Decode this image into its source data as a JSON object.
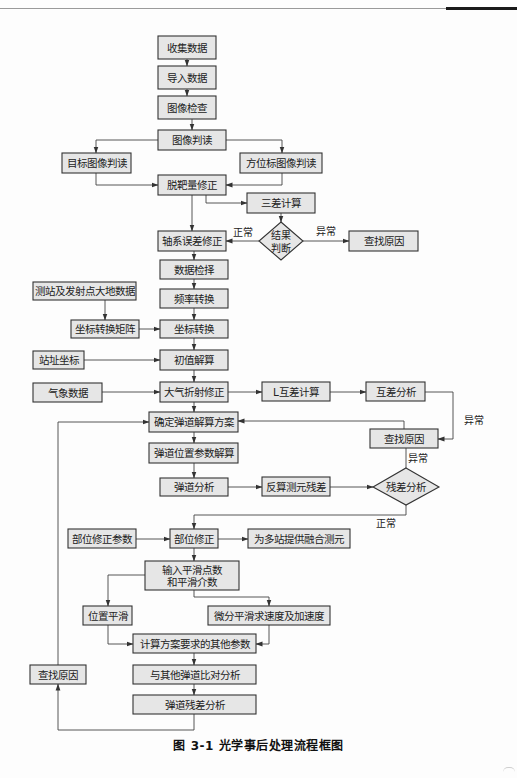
{
  "figure": {
    "caption": "图 3-1    光学事后处理流程框图",
    "colors": {
      "box_fill": "#e6e6e6",
      "box_stroke": "#333333",
      "line": "#444444",
      "background": "#fdfdfd"
    }
  },
  "nodes": {
    "collect_data": "收集数据",
    "import_data": "导入数据",
    "image_check": "图像检查",
    "image_interpret": "图像判读",
    "target_image_interpret": "目标图像判读",
    "azimuth_mark_interpret": "方位标图像判读",
    "miss_distance_correction": "脱靶量修正",
    "three_diff_calc": "三差计算",
    "result_judge_line1": "结果",
    "result_judge_line2": "判断",
    "find_cause_top": "查找原因",
    "axis_error_correction": "轴系误差修正",
    "data_selection": "数据检择",
    "station_geodetic_data": "测站及发射点大地数据",
    "frequency_conversion": "频率转换",
    "coord_transform_matrix": "坐标转换矩阵",
    "coord_transform": "坐标转换",
    "station_coords": "站址坐标",
    "initial_solution": "初值解算",
    "meteorological_data": "气象数据",
    "atmos_refraction_correction": "大气折射修正",
    "l_mutual_diff_calc": "L互差计算",
    "mutual_diff_analysis": "互差分析",
    "determine_trajectory_plan": "确定弹道解算方案",
    "find_cause_mid": "查找原因",
    "trajectory_position_solution": "弹道位置参数解算",
    "trajectory_analysis": "弹道分析",
    "back_calc_residual": "反算测元残差",
    "residual_analysis": "残差分析",
    "part_correction_params": "部位修正参数",
    "part_correction": "部位修正",
    "multi_station_fusion": "为多站提供融合测元",
    "smoothing_input_line1": "输入平滑点数",
    "smoothing_input_line2": "和平滑介数",
    "position_smoothing": "位置平滑",
    "diff_smoothing_vel_acc": "微分平滑求速度及加速度",
    "calc_other_params": "计算方案要求的其他参数",
    "compare_other_trajectories": "与其他弹道比对分析",
    "find_cause_bottom": "查找原因",
    "trajectory_residual_analysis": "弹道残差分析"
  },
  "edge_labels": {
    "normal_left": "正常",
    "abnormal_right": "异常",
    "abnormal_mutual": "异常",
    "abnormal_residual": "异常",
    "normal_residual": "正常"
  }
}
